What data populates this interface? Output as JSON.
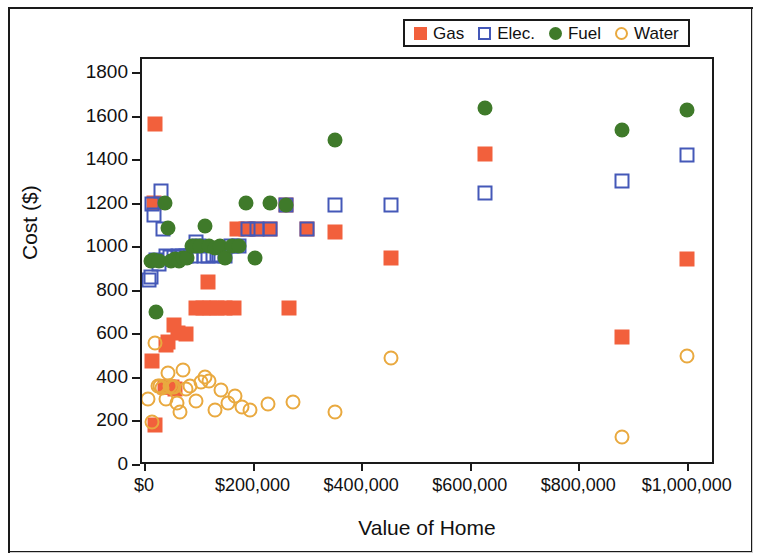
{
  "chart_data": {
    "type": "scatter",
    "title": "",
    "xlabel": "Value of Home",
    "ylabel": "Cost ($)",
    "xlim": [
      0,
      1050000
    ],
    "ylim": [
      0,
      1800
    ],
    "grid": false,
    "legend_position": "top-right",
    "x_ticks": [
      {
        "value": 0,
        "label": "$0"
      },
      {
        "value": 200000,
        "label": "$200,000"
      },
      {
        "value": 400000,
        "label": "$400,000"
      },
      {
        "value": 600000,
        "label": "$600,000"
      },
      {
        "value": 800000,
        "label": "$800,000"
      },
      {
        "value": 1000000,
        "label": "$1,000,000"
      }
    ],
    "y_ticks": [
      {
        "value": 0,
        "label": "0"
      },
      {
        "value": 200,
        "label": "200"
      },
      {
        "value": 400,
        "label": "400"
      },
      {
        "value": 600,
        "label": "600"
      },
      {
        "value": 800,
        "label": "800"
      },
      {
        "value": 1000,
        "label": "1000"
      },
      {
        "value": 1200,
        "label": "1200"
      },
      {
        "value": 1400,
        "label": "1400"
      },
      {
        "value": 1600,
        "label": "1600"
      },
      {
        "value": 1800,
        "label": "1800"
      }
    ],
    "series": [
      {
        "name": "Gas",
        "marker": "filled-square",
        "color": "#F2603C",
        "points": [
          [
            20000,
            1560
          ],
          [
            18000,
            1200
          ],
          [
            20000,
            180
          ],
          [
            15000,
            475
          ],
          [
            38000,
            355
          ],
          [
            45000,
            355
          ],
          [
            52000,
            355
          ],
          [
            58000,
            345
          ],
          [
            40000,
            545
          ],
          [
            45000,
            560
          ],
          [
            55000,
            640
          ],
          [
            62000,
            600
          ],
          [
            78000,
            598
          ],
          [
            95000,
            718
          ],
          [
            108000,
            718
          ],
          [
            122000,
            718
          ],
          [
            118000,
            835
          ],
          [
            135000,
            718
          ],
          [
            150000,
            718
          ],
          [
            165000,
            718
          ],
          [
            172000,
            1080
          ],
          [
            188000,
            1080
          ],
          [
            205000,
            1080
          ],
          [
            232000,
            1080
          ],
          [
            262000,
            1190
          ],
          [
            268000,
            718
          ],
          [
            300000,
            1080
          ],
          [
            352000,
            1065
          ],
          [
            455000,
            945
          ],
          [
            628000,
            1425
          ],
          [
            880000,
            585
          ],
          [
            1000000,
            940
          ]
        ]
      },
      {
        "name": "Elec.",
        "marker": "open-square",
        "color": "#4458B8",
        "points": [
          [
            10000,
            845
          ],
          [
            12000,
            860
          ],
          [
            15000,
            1195
          ],
          [
            18000,
            1145
          ],
          [
            22000,
            935
          ],
          [
            28000,
            920
          ],
          [
            32000,
            1255
          ],
          [
            35000,
            1080
          ],
          [
            40000,
            955
          ],
          [
            48000,
            950
          ],
          [
            55000,
            950
          ],
          [
            62000,
            955
          ],
          [
            70000,
            955
          ],
          [
            78000,
            955
          ],
          [
            86000,
            955
          ],
          [
            95000,
            1020
          ],
          [
            102000,
            1000
          ],
          [
            110000,
            955
          ],
          [
            118000,
            955
          ],
          [
            128000,
            960
          ],
          [
            138000,
            955
          ],
          [
            150000,
            955
          ],
          [
            160000,
            1000
          ],
          [
            175000,
            1000
          ],
          [
            192000,
            1080
          ],
          [
            208000,
            1080
          ],
          [
            232000,
            1080
          ],
          [
            262000,
            1190
          ],
          [
            300000,
            1080
          ],
          [
            352000,
            1190
          ],
          [
            455000,
            1190
          ],
          [
            628000,
            1245
          ],
          [
            880000,
            1300
          ],
          [
            1000000,
            1420
          ]
        ]
      },
      {
        "name": "Fuel",
        "marker": "filled-circle",
        "color": "#3F7A2A",
        "points": [
          [
            12000,
            930
          ],
          [
            18000,
            935
          ],
          [
            22000,
            700
          ],
          [
            28000,
            930
          ],
          [
            38000,
            1200
          ],
          [
            45000,
            1085
          ],
          [
            50000,
            930
          ],
          [
            58000,
            940
          ],
          [
            65000,
            930
          ],
          [
            72000,
            945
          ],
          [
            80000,
            945
          ],
          [
            88000,
            1000
          ],
          [
            96000,
            1000
          ],
          [
            104000,
            1000
          ],
          [
            112000,
            1095
          ],
          [
            120000,
            1000
          ],
          [
            130000,
            990
          ],
          [
            140000,
            1000
          ],
          [
            150000,
            945
          ],
          [
            162000,
            1000
          ],
          [
            175000,
            1000
          ],
          [
            188000,
            1200
          ],
          [
            205000,
            945
          ],
          [
            232000,
            1200
          ],
          [
            262000,
            1190
          ],
          [
            352000,
            1490
          ],
          [
            628000,
            1635
          ],
          [
            880000,
            1535
          ],
          [
            1000000,
            1625
          ]
        ]
      },
      {
        "name": "Water",
        "marker": "open-circle",
        "color": "#E9A93F",
        "points": [
          [
            8000,
            300
          ],
          [
            14000,
            195
          ],
          [
            20000,
            555
          ],
          [
            26000,
            360
          ],
          [
            30000,
            360
          ],
          [
            34000,
            350
          ],
          [
            40000,
            300
          ],
          [
            44000,
            420
          ],
          [
            48000,
            360
          ],
          [
            52000,
            355
          ],
          [
            56000,
            355
          ],
          [
            60000,
            280
          ],
          [
            66000,
            240
          ],
          [
            72000,
            430
          ],
          [
            78000,
            345
          ],
          [
            85000,
            360
          ],
          [
            95000,
            290
          ],
          [
            105000,
            375
          ],
          [
            112000,
            400
          ],
          [
            120000,
            380
          ],
          [
            130000,
            250
          ],
          [
            142000,
            340
          ],
          [
            155000,
            280
          ],
          [
            168000,
            310
          ],
          [
            180000,
            260
          ],
          [
            196000,
            250
          ],
          [
            228000,
            275
          ],
          [
            275000,
            285
          ],
          [
            352000,
            240
          ],
          [
            455000,
            485
          ],
          [
            880000,
            125
          ],
          [
            1000000,
            495
          ]
        ]
      }
    ]
  },
  "legend": {
    "items": [
      {
        "label": "Gas",
        "marker": "filled-square",
        "color": "#F2603C"
      },
      {
        "label": "Elec.",
        "marker": "open-square",
        "color": "#4458B8"
      },
      {
        "label": "Fuel",
        "marker": "filled-circle",
        "color": "#3F7A2A"
      },
      {
        "label": "Water",
        "marker": "open-circle",
        "color": "#E9A93F"
      }
    ]
  }
}
